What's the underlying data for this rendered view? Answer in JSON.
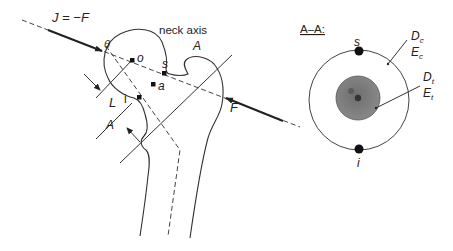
{
  "diagram": {
    "main": {
      "force_label_left": "J = −F",
      "theta_label": "θ",
      "neck_axis_label": "neck axis",
      "point_o": "o",
      "point_s": "s",
      "point_a": "a",
      "point_i": "i",
      "section_label_top": "A",
      "section_label_bottom": "A",
      "length_label": "L",
      "force_label_right": "F"
    },
    "section": {
      "title": "A–A:",
      "point_s": "s",
      "point_i": "i",
      "cortical_label_D": "D",
      "cortical_label_D_sub": "c",
      "cortical_label_E": "E",
      "cortical_label_E_sub": "c",
      "trabecular_label_D": "D",
      "trabecular_label_D_sub": "t",
      "trabecular_label_E": "E",
      "trabecular_label_E_sub": "t"
    },
    "colors": {
      "line": "#333333",
      "trabecular_fill": "#7a7a7a",
      "background": "#ffffff"
    }
  }
}
